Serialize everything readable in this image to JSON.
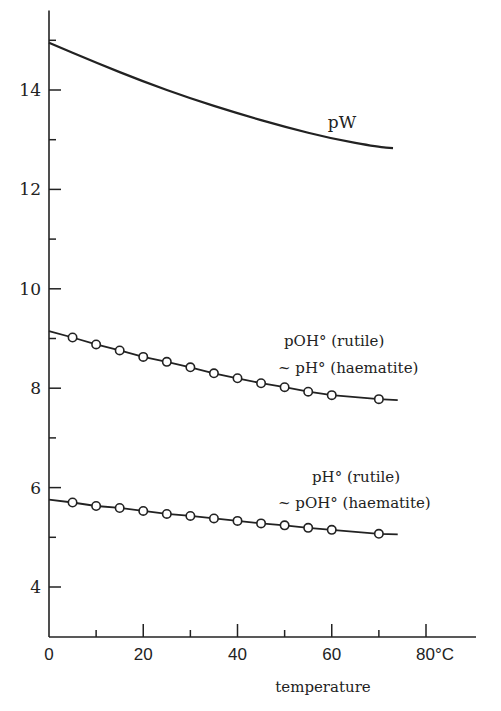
{
  "chart_data": {
    "type": "line",
    "title": "",
    "xlabel": "temperature",
    "ylabel": "",
    "xlim": [
      0,
      88
    ],
    "ylim": [
      3.0,
      15.6
    ],
    "grid": false,
    "x_ticks": [
      {
        "value": 0,
        "label": "0"
      },
      {
        "value": 20,
        "label": "20"
      },
      {
        "value": 40,
        "label": "40"
      },
      {
        "value": 60,
        "label": "60"
      },
      {
        "value": 80,
        "label": "80°C"
      }
    ],
    "x_minor_ticks": [
      10,
      30,
      50,
      70
    ],
    "y_ticks": [
      {
        "value": 4,
        "label": "4"
      },
      {
        "value": 6,
        "label": "6"
      },
      {
        "value": 8,
        "label": "8"
      },
      {
        "value": 10,
        "label": "10"
      },
      {
        "value": 12,
        "label": "12"
      },
      {
        "value": 14,
        "label": "14"
      }
    ],
    "y_minor_ticks": [
      5,
      7,
      9,
      11,
      13,
      15
    ],
    "series": [
      {
        "name": "pW",
        "label": "pW",
        "marker": "none",
        "x": [
          0,
          10,
          20,
          30,
          40,
          50,
          60,
          70,
          73
        ],
        "y": [
          14.95,
          14.55,
          14.17,
          13.83,
          13.53,
          13.26,
          13.02,
          12.85,
          12.83
        ]
      },
      {
        "name": "pOH° (rutile) ~ pH° (haematite)",
        "label_lines": [
          "pOH° (rutile)",
          "~ pH° (haematite)"
        ],
        "marker": "open-circle",
        "line_x": [
          0,
          74
        ],
        "x": [
          5,
          10,
          15,
          20,
          25,
          30,
          35,
          40,
          45,
          50,
          55,
          60,
          70
        ],
        "y": [
          9.02,
          8.88,
          8.76,
          8.63,
          8.53,
          8.42,
          8.3,
          8.2,
          8.1,
          8.02,
          7.93,
          7.86,
          7.78
        ],
        "y0": 9.15,
        "y_end": 7.76
      },
      {
        "name": "pH° (rutile) ~ pOH° (haematite)",
        "label_lines": [
          "pH° (rutile)",
          "~ pOH° (haematite)"
        ],
        "marker": "open-circle",
        "x": [
          5,
          10,
          15,
          20,
          25,
          30,
          35,
          40,
          45,
          50,
          55,
          60,
          70
        ],
        "y": [
          5.7,
          5.63,
          5.59,
          5.53,
          5.47,
          5.43,
          5.38,
          5.33,
          5.28,
          5.24,
          5.19,
          5.15,
          5.07
        ],
        "y0": 5.76,
        "y_end": 5.06
      }
    ]
  }
}
